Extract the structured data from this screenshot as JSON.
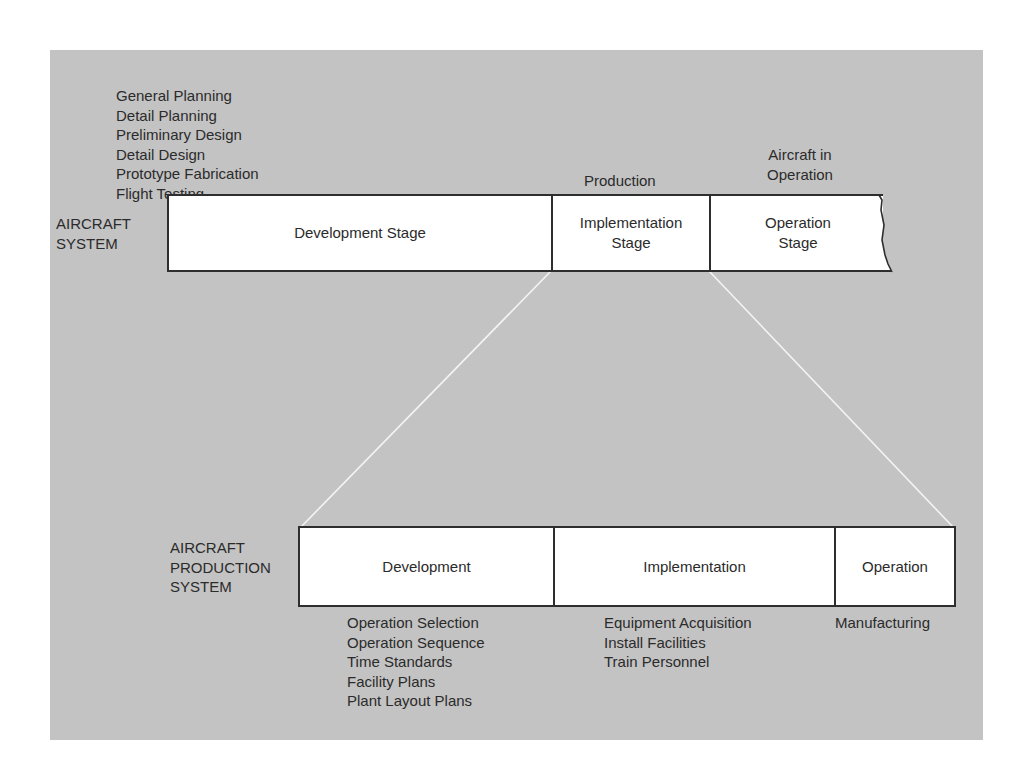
{
  "diagram": {
    "background_color": "#c3c3c3",
    "top_system": {
      "label_lines": [
        "AIRCRAFT",
        "SYSTEM"
      ],
      "above_development": [
        "General Planning",
        "Detail Planning",
        "Preliminary Design",
        "Detail Design",
        "Prototype Fabrication",
        "Flight Testing"
      ],
      "above_implementation": "Production",
      "above_operation_lines": [
        "Aircraft in",
        "Operation"
      ],
      "stages": [
        {
          "lines": [
            "Development Stage"
          ]
        },
        {
          "lines": [
            "Implementation",
            "Stage"
          ]
        },
        {
          "lines": [
            "Operation",
            "Stage"
          ]
        }
      ]
    },
    "bottom_system": {
      "label_lines": [
        "AIRCRAFT",
        "PRODUCTION",
        "SYSTEM"
      ],
      "stages": [
        {
          "label": "Development"
        },
        {
          "label": "Implementation"
        },
        {
          "label": "Operation"
        }
      ],
      "below_development": [
        "Operation Selection",
        "Operation Sequence",
        "Time Standards",
        "Facility Plans",
        "Plant Layout Plans"
      ],
      "below_implementation": [
        "Equipment Acquisition",
        "Install Facilities",
        "Train Personnel"
      ],
      "below_operation": [
        "Manufacturing"
      ]
    }
  }
}
